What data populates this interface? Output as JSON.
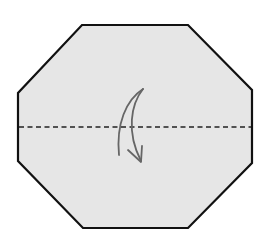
{
  "diagram": {
    "type": "origami-step",
    "description": "Valley fold the octagon in half along the horizontal center line",
    "shape": "octagon",
    "fold_type": "valley-fold",
    "fold_direction": "top-to-bottom",
    "colors": {
      "paper_fill": "#e6e6e6",
      "outline": "#111111",
      "fold_line": "#222222",
      "arrow": "#666666",
      "background": "#ffffff"
    },
    "octagon_points": [
      [
        82,
        25
      ],
      [
        188,
        25
      ],
      [
        252,
        90
      ],
      [
        252,
        163
      ],
      [
        188,
        228
      ],
      [
        83,
        228
      ],
      [
        18,
        161
      ],
      [
        18,
        93
      ]
    ],
    "fold_line": {
      "x1": 18,
      "y1": 127,
      "x2": 252,
      "y2": 127,
      "dash": "5,3.5"
    },
    "arrow": {
      "start": [
        143,
        89
      ],
      "end": [
        141,
        162
      ],
      "style": "curved-crescent"
    }
  }
}
